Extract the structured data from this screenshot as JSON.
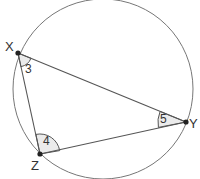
{
  "diagram": {
    "type": "inscribed-triangle-in-circle",
    "colors": {
      "background": "#ffffff",
      "circle_stroke": "#777777",
      "line_stroke": "#555555",
      "angle_fill": "#ebebeb",
      "point_fill": "#222222",
      "text": "#333333"
    },
    "circle": {
      "cx": 103,
      "cy": 89,
      "r": 90
    },
    "points": {
      "X": {
        "label": "X",
        "x": 18,
        "y": 53,
        "label_x": 5,
        "label_y": 51
      },
      "Y": {
        "label": "Y",
        "x": 186,
        "y": 122,
        "label_x": 189,
        "label_y": 128
      },
      "Z": {
        "label": "Z",
        "x": 40,
        "y": 154,
        "label_x": 31,
        "label_y": 170
      }
    },
    "angles": {
      "X": {
        "label": "3",
        "label_x": 29,
        "label_y": 73
      },
      "Z": {
        "label": "4",
        "label_x": 47,
        "label_y": 145
      },
      "Y": {
        "label": "5",
        "label_x": 158,
        "label_y": 123
      }
    }
  }
}
